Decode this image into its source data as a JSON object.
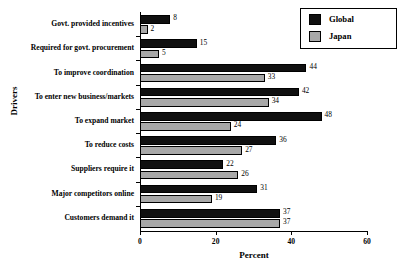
{
  "chart_data": {
    "type": "bar",
    "orientation": "horizontal",
    "title": "",
    "xlabel": "Percent",
    "ylabel": "Drivers",
    "xlim": [
      0,
      60
    ],
    "xticks": [
      0,
      20,
      40,
      60
    ],
    "xtick_labels": [
      "0",
      "20",
      "40",
      "60"
    ],
    "grid": false,
    "legend_position": "top-right",
    "categories": [
      "Govt. provided incentives",
      "Required for govt. procurement",
      "To improve coordination",
      "To enter new business/markets",
      "To expand market",
      "To reduce costs",
      "Suppliers require it",
      "Major competitors online",
      "Customers demand it"
    ],
    "series": [
      {
        "name": "Global",
        "color": "#101010",
        "values": [
          8,
          15,
          44,
          42,
          48,
          36,
          22,
          31,
          37
        ]
      },
      {
        "name": "Japan",
        "color": "#a8a8a8",
        "values": [
          2,
          5,
          33,
          34,
          24,
          27,
          26,
          19,
          37
        ]
      }
    ]
  },
  "legend": {
    "items": [
      {
        "label": "Global",
        "color": "#101010"
      },
      {
        "label": "Japan",
        "color": "#a8a8a8"
      }
    ]
  }
}
